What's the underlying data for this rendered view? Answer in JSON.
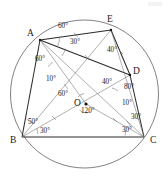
{
  "figure": {
    "background": "#ffffff",
    "stroke_color": "#2b2b2b",
    "light_stroke_color": "#6e6e6e",
    "degree_symbol": "°",
    "circle": {
      "cx": 84.5,
      "cy": 94,
      "r": 74
    },
    "vertices": [
      {
        "id": "A",
        "label": "A",
        "x": 40,
        "y": 40,
        "label_x": 27,
        "label_y": 36
      },
      {
        "id": "E",
        "label": "E",
        "x": 111,
        "y": 30,
        "label_x": 107,
        "label_y": 22
      },
      {
        "id": "D",
        "label": "D",
        "x": 130,
        "y": 75,
        "label_x": 133,
        "label_y": 74
      },
      {
        "id": "C",
        "label": "C",
        "x": 144,
        "y": 137,
        "label_x": 150,
        "label_y": 143
      },
      {
        "id": "B",
        "label": "B",
        "x": 22,
        "y": 137,
        "label_x": 10,
        "label_y": 143
      },
      {
        "id": "O",
        "label": "O",
        "x": 86,
        "y": 104,
        "label_x": 74,
        "label_y": 106
      }
    ],
    "angles": [
      {
        "id": "a-top-60",
        "value": "60",
        "text": "60°",
        "x": 58,
        "y": 28,
        "at": "A"
      },
      {
        "id": "a-30",
        "value": "30",
        "text": "30°",
        "x": 70,
        "y": 44,
        "at": "A"
      },
      {
        "id": "a-left-60",
        "value": "60",
        "text": "60°",
        "x": 35,
        "y": 61,
        "at": "A"
      },
      {
        "id": "a-10",
        "value": "10",
        "text": "10°",
        "x": 46,
        "y": 81,
        "at": "A"
      },
      {
        "id": "e-40",
        "value": "40",
        "text": "40°",
        "x": 107,
        "y": 52,
        "at": "E"
      },
      {
        "id": "mid-60",
        "value": "60",
        "text": "60°",
        "x": 58,
        "y": 96,
        "at": "O"
      },
      {
        "id": "o-120",
        "value": "120",
        "text": "120°",
        "x": 81,
        "y": 113,
        "at": "O"
      },
      {
        "id": "d-40",
        "value": "40",
        "text": "40°",
        "x": 102,
        "y": 84,
        "at": "D"
      },
      {
        "id": "d-80",
        "value": "80",
        "text": "80°",
        "x": 124,
        "y": 89,
        "at": "D"
      },
      {
        "id": "c-10",
        "value": "10",
        "text": "10°",
        "x": 122,
        "y": 105,
        "at": "C"
      },
      {
        "id": "c-30-upper",
        "value": "30",
        "text": "30°",
        "x": 131,
        "y": 119,
        "at": "C"
      },
      {
        "id": "c-30-base",
        "value": "30",
        "text": "30°",
        "x": 122,
        "y": 132,
        "at": "C"
      },
      {
        "id": "b-50",
        "value": "50",
        "text": "50°",
        "x": 28,
        "y": 124,
        "at": "B"
      },
      {
        "id": "b-30",
        "value": "30",
        "text": "30°",
        "x": 40,
        "y": 133,
        "at": "B"
      }
    ],
    "segments": [
      {
        "id": "AB",
        "from": "A",
        "to": "B",
        "weight": "med"
      },
      {
        "id": "BC",
        "from": "B",
        "to": "C",
        "weight": "med"
      },
      {
        "id": "AE",
        "from": "A",
        "to": "E",
        "weight": "med"
      },
      {
        "id": "ED",
        "from": "E",
        "to": "D",
        "weight": "med"
      },
      {
        "id": "DC",
        "from": "D",
        "to": "C",
        "weight": "med"
      },
      {
        "id": "AD",
        "from": "A",
        "to": "D",
        "weight": "med"
      },
      {
        "id": "AC",
        "from": "A",
        "to": "C",
        "weight": "thin"
      },
      {
        "id": "BE",
        "from": "B",
        "to": "E",
        "weight": "thin"
      },
      {
        "id": "EC",
        "from": "E",
        "to": "C",
        "weight": "thin"
      },
      {
        "id": "BD",
        "from": "B",
        "to": "D",
        "weight": "thin"
      },
      {
        "id": "AO",
        "from": "A",
        "to": "O",
        "weight": "thin"
      },
      {
        "id": "OC",
        "from": "O",
        "to": "C",
        "weight": "thin"
      }
    ]
  }
}
